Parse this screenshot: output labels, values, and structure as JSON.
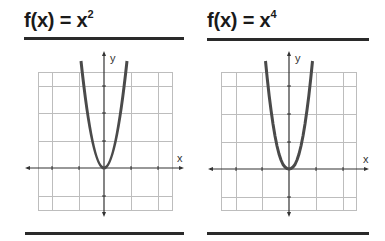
{
  "panels": [
    {
      "title": {
        "prefix": "f(x) = x",
        "exponent": "2"
      },
      "function": "x^2",
      "axis_labels": {
        "x": "x",
        "y": "y"
      }
    },
    {
      "title": {
        "prefix": "f(x) = x",
        "exponent": "4"
      },
      "function": "x^4",
      "axis_labels": {
        "x": "x",
        "y": "y"
      }
    }
  ],
  "colors": {
    "curve": "#4a4a4a",
    "grid": "#bdbdbd",
    "axis": "#333333",
    "rule": "#2a2a2a",
    "text": "#1a1a1a"
  }
}
